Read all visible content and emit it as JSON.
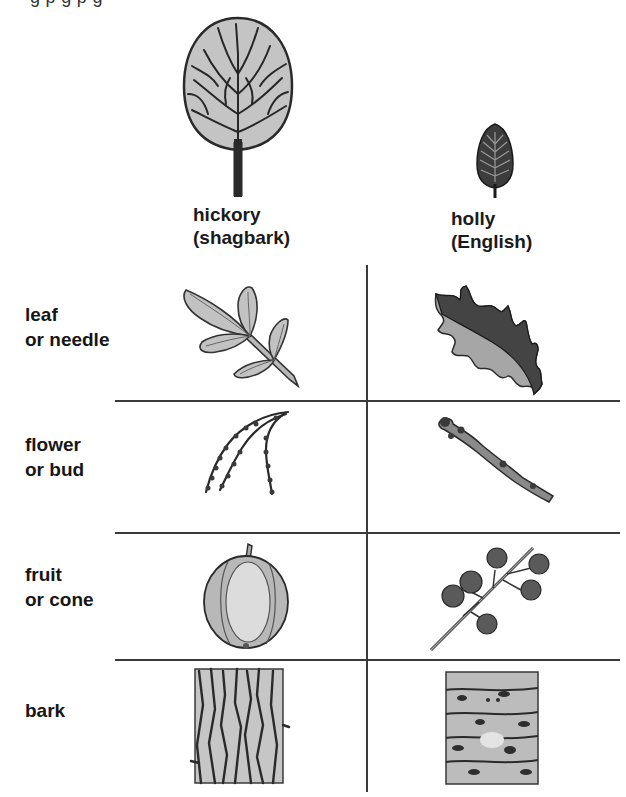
{
  "page": {
    "top_clipped_text": "g     p                                      g             p   g"
  },
  "columns": [
    {
      "name": "hickory",
      "line1": "hickory",
      "line2": "(shagbark)",
      "tree_icon": "round-deciduous-tree-icon"
    },
    {
      "name": "holly",
      "line1": "holly",
      "line2": "(English)",
      "tree_icon": "conical-evergreen-tree-icon"
    }
  ],
  "rows": [
    {
      "line1": "leaf",
      "line2": "or needle",
      "cells": [
        "compound-leaf-icon",
        "spiny-holly-leaf-icon"
      ]
    },
    {
      "line1": "flower",
      "line2": "or bud",
      "cells": [
        "catkin-flower-icon",
        "twig-bud-icon"
      ]
    },
    {
      "line1": "fruit",
      "line2": "or cone",
      "cells": [
        "hickory-nut-icon",
        "holly-berries-icon"
      ]
    },
    {
      "line1": "bark",
      "line2": "",
      "cells": [
        "shaggy-bark-icon",
        "smooth-warty-bark-icon"
      ]
    }
  ],
  "colors": {
    "ink": "#1a1a1a",
    "rule": "#3a3a3a",
    "fill_light": "#c8c8c8",
    "fill_mid": "#a8a8a8",
    "fill_dark": "#4a4a4a"
  }
}
